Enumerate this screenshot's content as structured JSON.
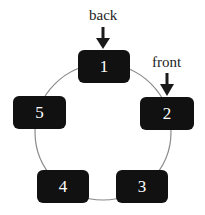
{
  "diagram": {
    "nodes": [
      {
        "id": "1",
        "label": "1"
      },
      {
        "id": "2",
        "label": "2"
      },
      {
        "id": "3",
        "label": "3"
      },
      {
        "id": "4",
        "label": "4"
      },
      {
        "id": "5",
        "label": "5"
      }
    ],
    "pointers": {
      "back": {
        "label": "back",
        "target": "1"
      },
      "front": {
        "label": "front",
        "target": "2"
      }
    },
    "colors": {
      "node_fill": "#111111",
      "node_text": "#ffffff",
      "ring": "#888888",
      "arrow": "#1a1a1a"
    }
  }
}
